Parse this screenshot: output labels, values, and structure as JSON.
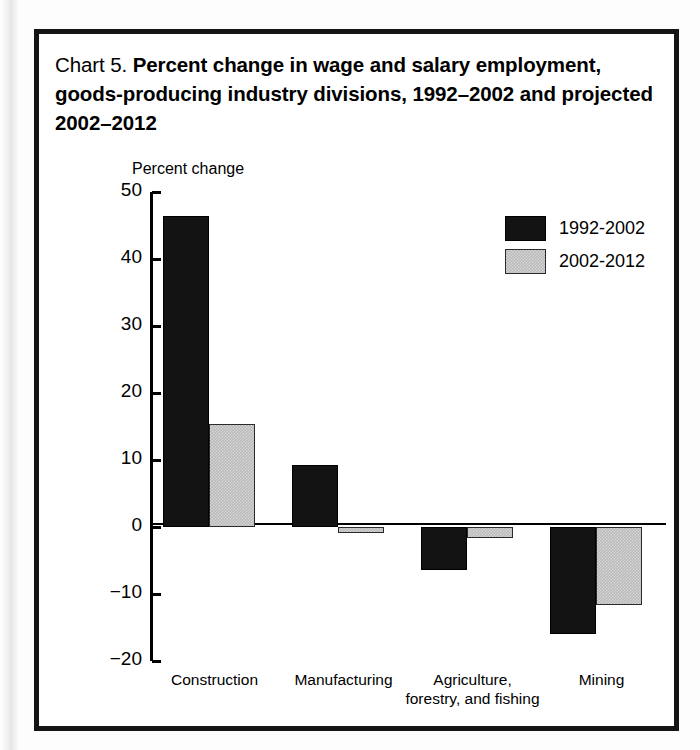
{
  "figure": {
    "label": "Chart 5.",
    "title": "Percent change in wage and salary employment, goods-producing industry divisions, 1992–2002 and projected 2002–2012"
  },
  "chart_data": {
    "type": "bar",
    "title": "Chart 5. Percent change in wage and salary employment, goods-producing industry divisions, 1992–2002 and projected 2002–2012",
    "xlabel": "",
    "ylabel": "Percent change",
    "ylim": [
      -20,
      50
    ],
    "yticks": [
      50,
      40,
      30,
      20,
      10,
      0,
      -10,
      -20
    ],
    "ytick_labels": [
      "50",
      "40",
      "30",
      "20",
      "10",
      "0",
      "−10",
      "−20"
    ],
    "grid": false,
    "legend_position": "top-right",
    "categories": [
      "Construction",
      "Manufacturing",
      "Agriculture, forestry, and fishing",
      "Mining"
    ],
    "category_lines": [
      [
        "Construction"
      ],
      [
        "Manufacturing"
      ],
      [
        "Agriculture,",
        "forestry, and fishing"
      ],
      [
        "Mining"
      ]
    ],
    "series": [
      {
        "name": "1992-2002",
        "color": "#131313",
        "values": [
          46.4,
          9.3,
          -6.4,
          -16.0
        ]
      },
      {
        "name": "2002-2012",
        "color": "#b9b9b9",
        "values": [
          15.3,
          -0.9,
          -1.6,
          -11.7
        ]
      }
    ]
  },
  "legend": {
    "items": [
      {
        "label": "1992-2002",
        "swatch": "black-swatch"
      },
      {
        "label": "2002-2012",
        "swatch": "gray-swatch"
      }
    ]
  }
}
